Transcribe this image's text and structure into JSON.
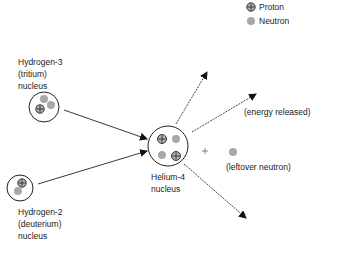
{
  "legend": {
    "items": [
      {
        "label": "Proton",
        "icon": "proton-circle-plus-icon"
      },
      {
        "label": "Neutron",
        "icon": "neutron-gray-dot-icon"
      }
    ]
  },
  "nuclei": {
    "tritium": {
      "line1": "Hydrogen-3",
      "line2": "(tritium)",
      "line3": "nucleus",
      "protons": 1,
      "neutrons": 2
    },
    "deuterium": {
      "line1": "Hydrogen-2",
      "line2": "(deuterium)",
      "line3": "nucleus",
      "protons": 1,
      "neutrons": 1
    },
    "helium": {
      "line1": "Helium-4",
      "line2": "nucleus",
      "protons": 2,
      "neutrons": 2
    }
  },
  "products": {
    "plus_sign": "+",
    "energy_label": "(energy released)",
    "neutron_label": "(leftover neutron)"
  },
  "colors": {
    "neutron": "#a8a8a8",
    "proton_fill": "#b0b0b0",
    "line": "#222222"
  }
}
